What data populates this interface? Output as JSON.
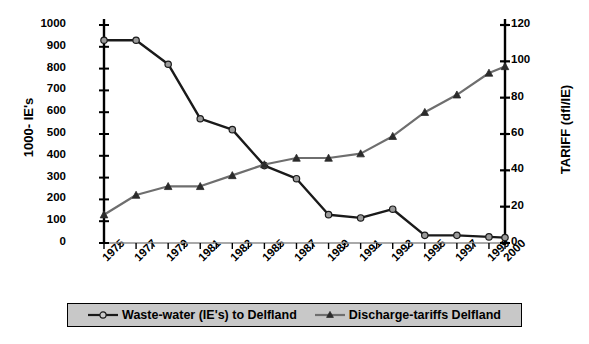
{
  "chart_data": {
    "type": "line",
    "title": "",
    "xlabel": "",
    "ylabel": "1000- IE's",
    "y2label": "TARIFF (dfl/IE)",
    "grid": false,
    "legend_position": "bottom",
    "x": [
      1975,
      1977,
      1979,
      1981,
      1983,
      1985,
      1987,
      1989,
      1991,
      1993,
      1995,
      1997,
      1999,
      2000
    ],
    "categories": [
      "1975",
      "1977",
      "1979",
      "1981",
      "1983",
      "1985",
      "1987",
      "1989",
      "1991",
      "1993",
      "1995",
      "1997",
      "1999",
      "2000"
    ],
    "xlim": [
      1975,
      2000
    ],
    "ylim": [
      0,
      1000
    ],
    "y2lim": [
      0,
      120
    ],
    "yticks": [
      0,
      100,
      200,
      300,
      400,
      500,
      600,
      700,
      800,
      900,
      1000
    ],
    "y2ticks": [
      0,
      20,
      40,
      60,
      80,
      100,
      120
    ],
    "ytick_labels": [
      "0",
      "100",
      "200",
      "300",
      "400",
      "500",
      "600",
      "700",
      "800",
      "900",
      "1000"
    ],
    "y2tick_labels": [
      "0",
      "20",
      "40",
      "60",
      "80",
      "100",
      "120"
    ],
    "series": [
      {
        "name": "Waste-water (IE's) to Delfland",
        "axis": "left",
        "marker": "circle",
        "color": "#1a1a1a",
        "marker_fill": "#9a9a9a",
        "values": [
          930,
          930,
          820,
          570,
          520,
          355,
          295,
          130,
          115,
          155,
          35,
          35,
          28,
          25
        ]
      },
      {
        "name": "Discharge-tariffs Delfland",
        "axis": "right",
        "marker": "triangle",
        "color": "#6e6e6e",
        "marker_fill": "#2b2b2b",
        "values": [
          15.6,
          26.4,
          31.2,
          31.2,
          37.2,
          43.2,
          46.8,
          46.8,
          49.2,
          58.8,
          72.0,
          81.6,
          93.6,
          97.2
        ]
      }
    ]
  },
  "axes": {
    "left_title": "1000- IE's",
    "right_title": "TARIFF (dfl/IE)"
  },
  "legend": {
    "items": [
      {
        "label": "Waste-water (IE's) to Delfland",
        "marker": "circle-marker"
      },
      {
        "label": "Discharge-tariffs Delfland",
        "marker": "triangle-marker"
      }
    ]
  }
}
